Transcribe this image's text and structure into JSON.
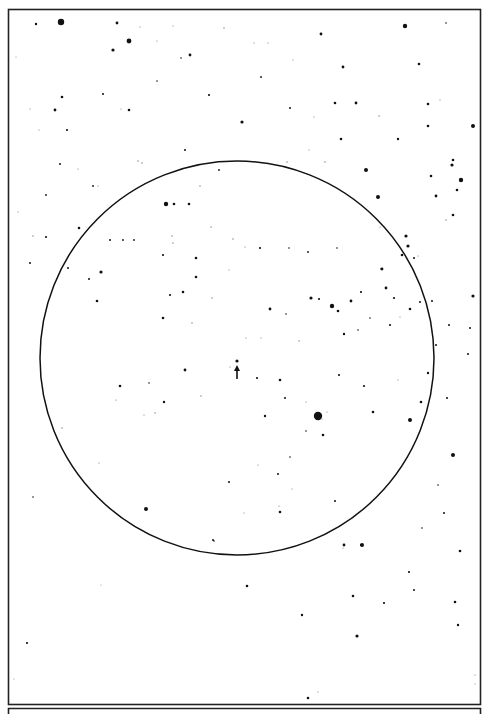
{
  "figure": {
    "kind": "star field chart",
    "colors": {
      "ink": "#111111",
      "paper": "#ffffff",
      "faint": "#777777"
    },
    "field_circle": {
      "center": [
        237,
        358
      ],
      "radius_units": 197
    },
    "marker": {
      "type": "arrow",
      "points": "up",
      "target_star_index": 0
    },
    "stars": [
      [
        237,
        361,
        1.6
      ],
      [
        61,
        22,
        3.2
      ],
      [
        117,
        23,
        1.4
      ],
      [
        36,
        24,
        1.2
      ],
      [
        129,
        41,
        2.4
      ],
      [
        113,
        50,
        1.6
      ],
      [
        173,
        26,
        0.6
      ],
      [
        157,
        41,
        0.6
      ],
      [
        190,
        55,
        1.4
      ],
      [
        181,
        58,
        0.8
      ],
      [
        140,
        27,
        0.6
      ],
      [
        224,
        28,
        0.7
      ],
      [
        16,
        57,
        0.5
      ],
      [
        62,
        97,
        1.3
      ],
      [
        103,
        94,
        1.0
      ],
      [
        55,
        110,
        1.4
      ],
      [
        129,
        110,
        1.3
      ],
      [
        121,
        109,
        0.6
      ],
      [
        67,
        130,
        1.1
      ],
      [
        157,
        81,
        0.8
      ],
      [
        209,
        95,
        1.1
      ],
      [
        242,
        122,
        1.6
      ],
      [
        30,
        109,
        0.6
      ],
      [
        39,
        130,
        0.6
      ],
      [
        185,
        150,
        1.0
      ],
      [
        142,
        163,
        0.7
      ],
      [
        60,
        164,
        1.0
      ],
      [
        78,
        169,
        0.6
      ],
      [
        138,
        161,
        0.7
      ],
      [
        219,
        170,
        0.9
      ],
      [
        321,
        34,
        1.4
      ],
      [
        261,
        77,
        0.9
      ],
      [
        343,
        67,
        1.4
      ],
      [
        405,
        26,
        2.2
      ],
      [
        419,
        64,
        1.3
      ],
      [
        446,
        23,
        0.8
      ],
      [
        293,
        60,
        0.6
      ],
      [
        254,
        43,
        0.6
      ],
      [
        268,
        43,
        0.6
      ],
      [
        335,
        103,
        1.3
      ],
      [
        356,
        103,
        1.4
      ],
      [
        379,
        116,
        0.7
      ],
      [
        290,
        108,
        1.0
      ],
      [
        314,
        117,
        0.6
      ],
      [
        428,
        104,
        1.3
      ],
      [
        440,
        100,
        0.6
      ],
      [
        428,
        126,
        1.3
      ],
      [
        473,
        126,
        2.0
      ],
      [
        341,
        139,
        1.3
      ],
      [
        398,
        139,
        1.2
      ],
      [
        366,
        170,
        2.0
      ],
      [
        287,
        162,
        0.7
      ],
      [
        325,
        162,
        0.7
      ],
      [
        309,
        150,
        0.6
      ],
      [
        453,
        160,
        1.3
      ],
      [
        452,
        165,
        1.6
      ],
      [
        461,
        180,
        2.2
      ],
      [
        431,
        176,
        1.3
      ],
      [
        436,
        196,
        1.4
      ],
      [
        457,
        190,
        1.3
      ],
      [
        93,
        186,
        0.9
      ],
      [
        98,
        186,
        0.6
      ],
      [
        166,
        204,
        2.2
      ],
      [
        174,
        204,
        1.3
      ],
      [
        189,
        204,
        1.3
      ],
      [
        200,
        186,
        0.7
      ],
      [
        46,
        195,
        0.9
      ],
      [
        46,
        237,
        1.1
      ],
      [
        79,
        228,
        1.3
      ],
      [
        33,
        236,
        0.7
      ],
      [
        30,
        263,
        1.0
      ],
      [
        68,
        268,
        1.0
      ],
      [
        101,
        272,
        1.6
      ],
      [
        89,
        279,
        1.0
      ],
      [
        97,
        301,
        1.3
      ],
      [
        110,
        240,
        1.0
      ],
      [
        123,
        240,
        0.9
      ],
      [
        134,
        240,
        0.9
      ],
      [
        172,
        236,
        0.7
      ],
      [
        163,
        255,
        1.1
      ],
      [
        173,
        243,
        0.7
      ],
      [
        196,
        258,
        1.3
      ],
      [
        196,
        277,
        1.3
      ],
      [
        212,
        298,
        0.7
      ],
      [
        170,
        295,
        1.1
      ],
      [
        183,
        292,
        1.3
      ],
      [
        163,
        318,
        1.3
      ],
      [
        192,
        323,
        0.7
      ],
      [
        233,
        239,
        0.7
      ],
      [
        229,
        270,
        0.6
      ],
      [
        211,
        227,
        0.7
      ],
      [
        18,
        212,
        0.6
      ],
      [
        378,
        197,
        2.0
      ],
      [
        380,
        227,
        0.6
      ],
      [
        406,
        236,
        1.6
      ],
      [
        408,
        246,
        1.6
      ],
      [
        402,
        255,
        1.3
      ],
      [
        414,
        258,
        1.0
      ],
      [
        453,
        215,
        1.3
      ],
      [
        260,
        248,
        1.1
      ],
      [
        289,
        248,
        0.8
      ],
      [
        308,
        252,
        0.9
      ],
      [
        337,
        248,
        0.8
      ],
      [
        382,
        269,
        1.4
      ],
      [
        386,
        288,
        1.4
      ],
      [
        361,
        292,
        1.1
      ],
      [
        381,
        269,
        0.8
      ],
      [
        245,
        247,
        0.6
      ],
      [
        311,
        298,
        1.6
      ],
      [
        319,
        299,
        1.1
      ],
      [
        332,
        306,
        2.2
      ],
      [
        351,
        301,
        1.4
      ],
      [
        338,
        311,
        1.3
      ],
      [
        394,
        298,
        1.1
      ],
      [
        410,
        309,
        1.3
      ],
      [
        420,
        302,
        1.0
      ],
      [
        370,
        318,
        0.8
      ],
      [
        270,
        309,
        1.4
      ],
      [
        286,
        314,
        0.8
      ],
      [
        299,
        341,
        0.7
      ],
      [
        344,
        334,
        1.2
      ],
      [
        358,
        330,
        0.8
      ],
      [
        246,
        338,
        0.6
      ],
      [
        261,
        338,
        0.6
      ],
      [
        390,
        325,
        1.1
      ],
      [
        400,
        317,
        0.6
      ],
      [
        432,
        301,
        1.0
      ],
      [
        418,
        256,
        0.6
      ],
      [
        446,
        220,
        0.7
      ],
      [
        473,
        296,
        1.6
      ],
      [
        470,
        328,
        1.0
      ],
      [
        449,
        325,
        1.0
      ],
      [
        428,
        373,
        1.2
      ],
      [
        436,
        345,
        1.0
      ],
      [
        468,
        354,
        1.0
      ],
      [
        185,
        370,
        1.4
      ],
      [
        120,
        386,
        1.3
      ],
      [
        149,
        383,
        0.8
      ],
      [
        164,
        402,
        1.2
      ],
      [
        116,
        400,
        0.6
      ],
      [
        201,
        396,
        0.7
      ],
      [
        285,
        398,
        1.0
      ],
      [
        306,
        402,
        0.6
      ],
      [
        364,
        386,
        1.1
      ],
      [
        339,
        375,
        1.1
      ],
      [
        257,
        378,
        1.1
      ],
      [
        280,
        380,
        1.3
      ],
      [
        230,
        367,
        0.6
      ],
      [
        265,
        416,
        1.2
      ],
      [
        318,
        416,
        4.2
      ],
      [
        322,
        419,
        0.6
      ],
      [
        306,
        431,
        0.8
      ],
      [
        323,
        435,
        1.3
      ],
      [
        373,
        412,
        1.3
      ],
      [
        327,
        412,
        0.6
      ],
      [
        421,
        402,
        1.3
      ],
      [
        447,
        398,
        1.0
      ],
      [
        398,
        380,
        0.6
      ],
      [
        410,
        420,
        2.0
      ],
      [
        62,
        428,
        0.7
      ],
      [
        99,
        463,
        0.6
      ],
      [
        155,
        413,
        0.7
      ],
      [
        144,
        415,
        0.6
      ],
      [
        146,
        509,
        2.0
      ],
      [
        33,
        497,
        0.8
      ],
      [
        229,
        482,
        1.0
      ],
      [
        278,
        474,
        1.0
      ],
      [
        258,
        465,
        0.6
      ],
      [
        290,
        457,
        0.8
      ],
      [
        280,
        512,
        1.3
      ],
      [
        292,
        489,
        0.6
      ],
      [
        279,
        506,
        0.6
      ],
      [
        244,
        513,
        0.6
      ],
      [
        213,
        540,
        1.0
      ],
      [
        453,
        455,
        2.0
      ],
      [
        444,
        513,
        1.0
      ],
      [
        460,
        551,
        1.3
      ],
      [
        344,
        545,
        1.4
      ],
      [
        361,
        545,
        1.1
      ],
      [
        422,
        528,
        0.8
      ],
      [
        335,
        501,
        1.0
      ],
      [
        438,
        485,
        0.8
      ],
      [
        247,
        586,
        1.3
      ],
      [
        214,
        541,
        0.8
      ],
      [
        362,
        545,
        2.0
      ],
      [
        343,
        548,
        0.6
      ],
      [
        409,
        572,
        1.1
      ],
      [
        414,
        590,
        1.0
      ],
      [
        353,
        596,
        1.3
      ],
      [
        384,
        603,
        1.1
      ],
      [
        302,
        615,
        1.2
      ],
      [
        357,
        636,
        1.6
      ],
      [
        455,
        602,
        1.3
      ],
      [
        458,
        625,
        1.2
      ],
      [
        27,
        643,
        1.1
      ],
      [
        308,
        698,
        1.3
      ],
      [
        318,
        692,
        0.6
      ],
      [
        101,
        585,
        0.5
      ],
      [
        475,
        675,
        0.6
      ],
      [
        14,
        679,
        0.5
      ],
      [
        475,
        684,
        0.5
      ]
    ]
  }
}
